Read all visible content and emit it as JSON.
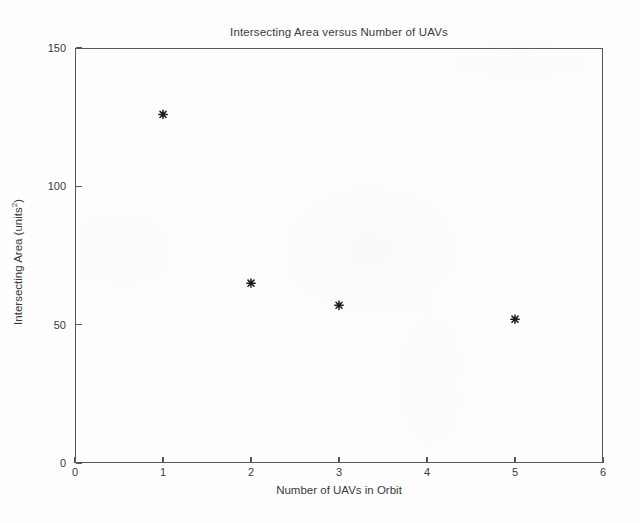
{
  "chart_data": {
    "type": "scatter",
    "title": "Intersecting Area versus Number of UAVs",
    "xlabel": "Number of UAVs in Orbit",
    "ylabel_text": "Intersecting Area (units",
    "ylabel_sup": "2",
    "ylabel_tail": ")",
    "ylabel_full": "Intersecting Area (units²)",
    "x": [
      1,
      2,
      3,
      5
    ],
    "y": [
      126,
      65,
      57,
      52
    ],
    "series": [
      {
        "name": "Intersecting Area",
        "marker": "asterisk",
        "color": "#1c1c1c",
        "points": [
          {
            "x": 1,
            "y": 126
          },
          {
            "x": 2,
            "y": 65
          },
          {
            "x": 3,
            "y": 57
          },
          {
            "x": 5,
            "y": 52
          }
        ]
      }
    ],
    "xlim": [
      0,
      6
    ],
    "ylim": [
      0,
      150
    ],
    "xticks": [
      0,
      1,
      2,
      3,
      4,
      5,
      6
    ],
    "yticks": [
      0,
      50,
      100,
      150
    ],
    "xticklabels": [
      "0",
      "1",
      "2",
      "3",
      "4",
      "5",
      "6"
    ],
    "yticklabels": [
      "0",
      "50",
      "100",
      "150"
    ],
    "grid": false,
    "legend": null,
    "legend_position": "none",
    "axis_color": "#58585a",
    "background_color": "#ffffff"
  }
}
